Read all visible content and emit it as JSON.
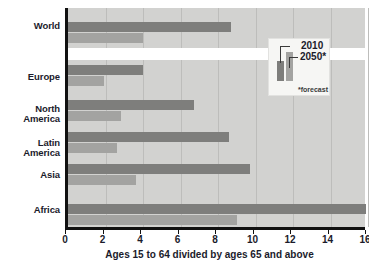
{
  "chart_data": {
    "type": "bar",
    "title": "",
    "xlabel": "Ages 15 to 64 divided by ages 65 and above",
    "ylabel": "",
    "orientation": "horizontal",
    "xlim": [
      0,
      16
    ],
    "xticks": [
      0,
      2,
      4,
      6,
      8,
      10,
      12,
      14,
      16
    ],
    "grid": "vertical",
    "categories": [
      "World",
      "Europe",
      "North America",
      "Latin America",
      "Asia",
      "Africa"
    ],
    "series": [
      {
        "name": "2010",
        "values": [
          8.7,
          4.0,
          6.7,
          8.6,
          9.7,
          15.9
        ],
        "color": "#7e7e7c"
      },
      {
        "name": "2050*",
        "values": [
          4.0,
          1.9,
          2.8,
          2.6,
          3.6,
          9.0
        ],
        "color": "#a3a3a1"
      }
    ],
    "legend": {
      "position": "inside-top-right",
      "entries": [
        "2010",
        "2050*"
      ],
      "note": "*forecast"
    },
    "plot_background": "#d2d2d0",
    "axis_color": "#111111"
  },
  "axis": {
    "title": "Ages 15 to 64 divided by ages 65 and above",
    "tick_labels": [
      "0",
      "2",
      "4",
      "6",
      "8",
      "10",
      "12",
      "14",
      "16"
    ]
  },
  "categories": [
    {
      "label": "World"
    },
    {
      "label": "Europe"
    },
    {
      "label": "North\nAmerica"
    },
    {
      "label": "Latin\nAmerica"
    },
    {
      "label": "Asia"
    },
    {
      "label": "Africa"
    }
  ],
  "category_labels": {
    "world": "World",
    "europe": "Europe",
    "north_america_line1": "North",
    "north_america_line2": "America",
    "latin_america_line1": "Latin",
    "latin_america_line2": "America",
    "asia": "Asia",
    "africa": "Africa"
  },
  "legend": {
    "label_2010": "2010",
    "label_2050": "2050*",
    "footnote": "*forecast"
  }
}
